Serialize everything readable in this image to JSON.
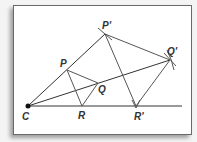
{
  "diagram": {
    "type": "dilation-construction",
    "center": {
      "label": "C",
      "x": 28,
      "y": 106
    },
    "points": [
      {
        "id": "P",
        "label": "P",
        "x": 67,
        "y": 70,
        "lx": 60,
        "ly": 67
      },
      {
        "id": "Q",
        "label": "Q",
        "x": 98,
        "y": 83,
        "lx": 98,
        "ly": 93
      },
      {
        "id": "R",
        "label": "R",
        "x": 82,
        "y": 106,
        "lx": 78,
        "ly": 119
      },
      {
        "id": "P'",
        "label": "P'",
        "x": 105,
        "y": 34,
        "lx": 100,
        "ly": 31
      },
      {
        "id": "Q'",
        "label": "Q'",
        "x": 170,
        "y": 60,
        "lx": 167,
        "ly": 56
      },
      {
        "id": "R'",
        "label": "R'",
        "x": 136,
        "y": 106,
        "lx": 134,
        "ly": 119
      }
    ],
    "colors": {
      "line": "#333333",
      "triangle": "#555555",
      "frame_border": "#6a6a6a"
    }
  }
}
